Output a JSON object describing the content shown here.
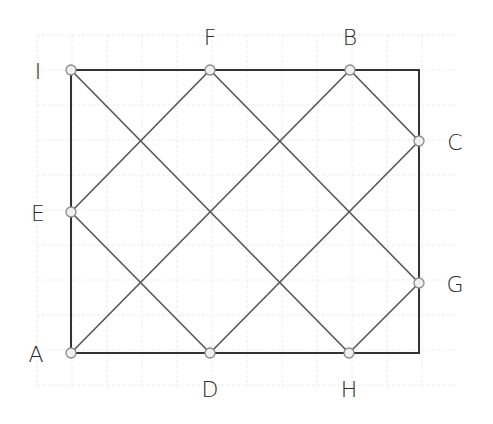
{
  "diagram": {
    "colors": {
      "background": "#ffffff",
      "grid": "#ececec",
      "frame": "#333333",
      "line": "#555555",
      "point_fill": "#f0f0f0",
      "point_stroke": "#8a8a8a"
    },
    "grid": {
      "x0": 2,
      "y0": 0,
      "step": 35,
      "xmin": 37,
      "xmax": 455,
      "ymin": 35,
      "ymax": 390
    },
    "rectangle": {
      "corners": [
        "A",
        "I"
      ],
      "x": 71,
      "y": 70,
      "width": 348,
      "height": 283
    },
    "points": [
      {
        "id": "A",
        "label": "A",
        "x": 71,
        "y": 353,
        "lx": 36,
        "ly": 362
      },
      {
        "id": "B",
        "label": "B",
        "x": 350,
        "y": 70,
        "lx": 350,
        "ly": 45
      },
      {
        "id": "C",
        "label": "C",
        "x": 419,
        "y": 141,
        "lx": 455,
        "ly": 150
      },
      {
        "id": "D",
        "label": "D",
        "x": 210,
        "y": 353,
        "lx": 210,
        "ly": 397
      },
      {
        "id": "E",
        "label": "E",
        "x": 71,
        "y": 212,
        "lx": 38,
        "ly": 221
      },
      {
        "id": "F",
        "label": "F",
        "x": 210,
        "y": 70,
        "lx": 210,
        "ly": 45
      },
      {
        "id": "G",
        "label": "G",
        "x": 419,
        "y": 283,
        "lx": 455,
        "ly": 292
      },
      {
        "id": "H",
        "label": "H",
        "x": 349,
        "y": 353,
        "lx": 349,
        "ly": 397
      },
      {
        "id": "I",
        "label": "I",
        "x": 71,
        "y": 70,
        "lx": 38,
        "ly": 79
      }
    ],
    "segments": [
      [
        "I",
        "H"
      ],
      [
        "F",
        "G"
      ],
      [
        "B",
        "C"
      ],
      [
        "E",
        "D"
      ],
      [
        "A",
        "B"
      ],
      [
        "E",
        "F"
      ],
      [
        "D",
        "C"
      ],
      [
        "H",
        "G"
      ]
    ]
  }
}
